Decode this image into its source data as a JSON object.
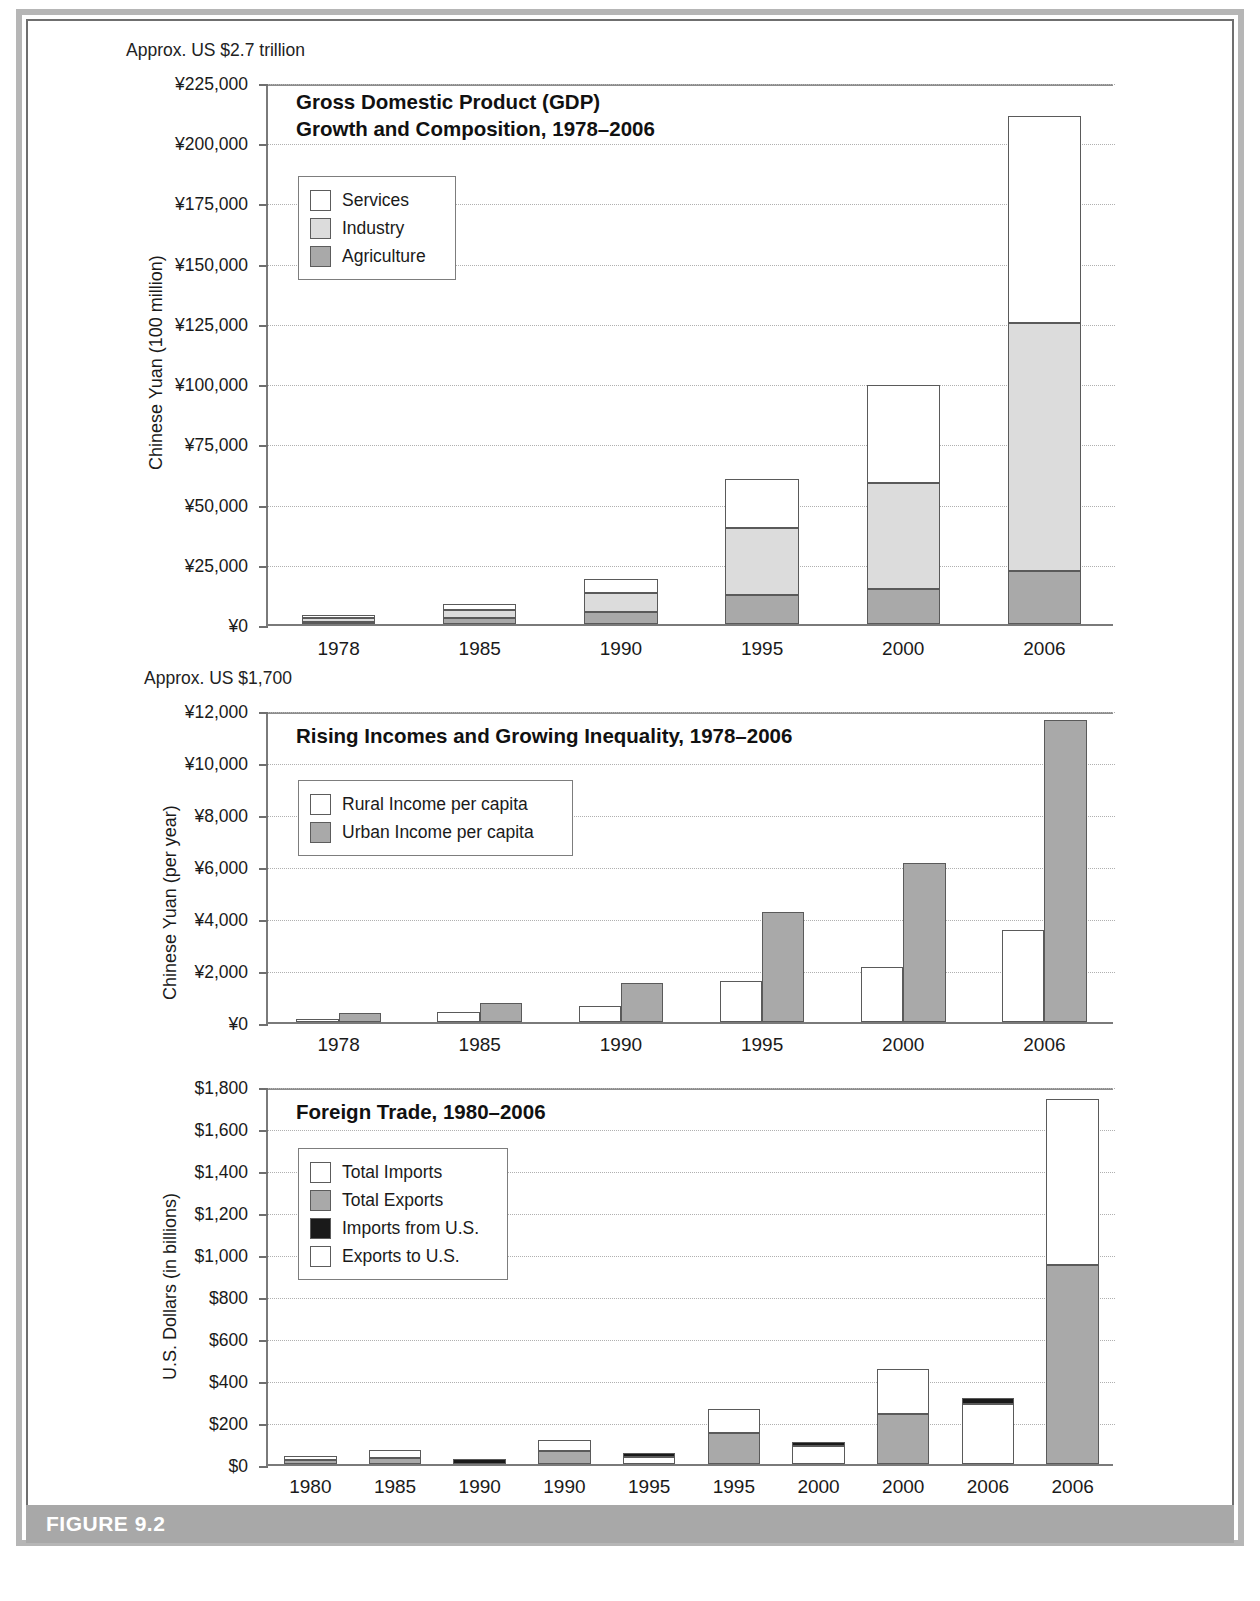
{
  "figure": {
    "label": "FIGURE 9.2"
  },
  "chart_data": [
    {
      "type": "bar",
      "stacked": true,
      "title": "Gross Domestic Product (GDP)\nGrowth and Composition, 1978–2006",
      "annotation": "Approx. US $2.7 trillion",
      "ylabel": "Chinese Yuan (100 million)",
      "xlabel": "",
      "ylim": [
        0,
        225000
      ],
      "ytick_values": [
        0,
        25000,
        50000,
        75000,
        100000,
        125000,
        150000,
        175000,
        200000,
        225000
      ],
      "ytick_labels": [
        "¥0",
        "¥25,000",
        "¥50,000",
        "¥75,000",
        "¥100,000",
        "¥125,000",
        "¥150,000",
        "¥175,000",
        "¥200,000",
        "¥225,000"
      ],
      "grid": true,
      "legend_position": "upper-left",
      "categories": [
        "1978",
        "1985",
        "1990",
        "1995",
        "2000",
        "2006"
      ],
      "series": [
        {
          "name": "Agriculture",
          "color": "#a9a9a9",
          "values": [
            1000,
            2600,
            5000,
            12000,
            14700,
            22000
          ]
        },
        {
          "name": "Industry",
          "color": "#dcdcdc",
          "values": [
            1700,
            3400,
            7700,
            28000,
            44000,
            103000
          ]
        },
        {
          "name": "Services",
          "color": "#ffffff",
          "values": [
            900,
            2500,
            6000,
            20000,
            40600,
            86000
          ]
        }
      ],
      "legend_entries": [
        "Services",
        "Industry",
        "Agriculture"
      ]
    },
    {
      "type": "bar",
      "stacked": false,
      "title": "Rising Incomes and Growing Inequality, 1978–2006",
      "annotation": "Approx. US $1,700",
      "ylabel": "Chinese Yuan (per year)",
      "xlabel": "",
      "ylim": [
        0,
        12000
      ],
      "ytick_values": [
        0,
        2000,
        4000,
        6000,
        8000,
        10000,
        12000
      ],
      "ytick_labels": [
        "¥0",
        "¥2,000",
        "¥4,000",
        "¥6,000",
        "¥8,000",
        "¥10,000",
        "¥12,000"
      ],
      "grid": true,
      "legend_position": "upper-left",
      "categories": [
        "1978",
        "1985",
        "1990",
        "1995",
        "2000",
        "2006"
      ],
      "series": [
        {
          "name": "Rural Income per capita",
          "color": "#ffffff",
          "values": [
            134,
            398,
            630,
            1578,
            2100,
            3530
          ]
        },
        {
          "name": "Urban Income per capita",
          "color": "#a9a9a9",
          "values": [
            343,
            739,
            1510,
            4230,
            6120,
            11620
          ]
        }
      ],
      "legend_entries": [
        "Rural Income per capita",
        "Urban Income per capita"
      ]
    },
    {
      "type": "bar",
      "stacked": true,
      "title": "Foreign Trade, 1980–2006",
      "annotation": "",
      "ylabel": "U.S. Dollars (in billions)",
      "xlabel": "",
      "ylim": [
        0,
        1800
      ],
      "ytick_values": [
        0,
        200,
        400,
        600,
        800,
        1000,
        1200,
        1400,
        1600,
        1800
      ],
      "ytick_labels": [
        "$0",
        "$200",
        "$400",
        "$600",
        "$800",
        "$1,000",
        "$1,200",
        "$1,400",
        "$1,600",
        "$1,800"
      ],
      "grid": true,
      "legend_position": "upper-left",
      "categories": [
        "1980",
        "1985",
        "1990",
        "1990",
        "1995",
        "1995",
        "2000",
        "2000",
        "2006",
        "2006"
      ],
      "legend_entries": [
        "Total Imports",
        "Total Exports",
        "Imports from U.S.",
        "Exports to U.S."
      ],
      "bars": [
        {
          "x": "1980",
          "segments": [
            {
              "name": "Total Exports",
              "value": 18,
              "color": "#a9a9a9"
            },
            {
              "name": "Total Imports",
              "value": 20,
              "color": "#ffffff"
            }
          ]
        },
        {
          "x": "1985",
          "segments": [
            {
              "name": "Total Exports",
              "value": 27,
              "color": "#a9a9a9"
            },
            {
              "name": "Total Imports",
              "value": 42,
              "color": "#ffffff"
            }
          ]
        },
        {
          "x": "1990",
          "segments": [
            {
              "name": "Imports from U.S.",
              "value": 22,
              "color": "#1a1a1a"
            }
          ]
        },
        {
          "x": "1990",
          "segments": [
            {
              "name": "Total Exports",
              "value": 62,
              "color": "#a9a9a9"
            },
            {
              "name": "Total Imports",
              "value": 50,
              "color": "#ffffff"
            }
          ]
        },
        {
          "x": "1995",
          "segments": [
            {
              "name": "Exports to U.S.",
              "value": 33,
              "color": "#ffffff"
            },
            {
              "name": "Imports from U.S.",
              "value": 16,
              "color": "#1a1a1a"
            }
          ]
        },
        {
          "x": "1995",
          "segments": [
            {
              "name": "Total Exports",
              "value": 148,
              "color": "#a9a9a9"
            },
            {
              "name": "Total Imports",
              "value": 116,
              "color": "#ffffff"
            }
          ]
        },
        {
          "x": "2000",
          "segments": [
            {
              "name": "Exports to U.S.",
              "value": 85,
              "color": "#ffffff"
            },
            {
              "name": "Imports from U.S.",
              "value": 22,
              "color": "#1a1a1a"
            }
          ]
        },
        {
          "x": "2000",
          "segments": [
            {
              "name": "Total Exports",
              "value": 240,
              "color": "#a9a9a9"
            },
            {
              "name": "Total Imports",
              "value": 214,
              "color": "#ffffff"
            }
          ]
        },
        {
          "x": "2006",
          "segments": [
            {
              "name": "Exports to U.S.",
              "value": 288,
              "color": "#ffffff"
            },
            {
              "name": "Imports from U.S.",
              "value": 28,
              "color": "#1a1a1a"
            }
          ]
        },
        {
          "x": "2006",
          "segments": [
            {
              "name": "Total Exports",
              "value": 950,
              "color": "#a9a9a9"
            },
            {
              "name": "Total Imports",
              "value": 790,
              "color": "#ffffff"
            }
          ]
        }
      ]
    }
  ]
}
